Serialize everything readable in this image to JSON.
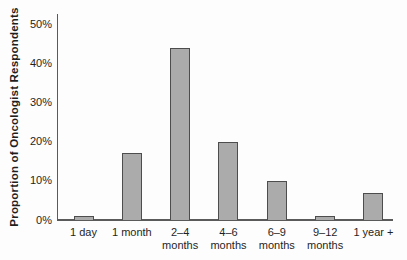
{
  "chart_data": {
    "type": "bar",
    "title": "",
    "xlabel": "",
    "ylabel": "Proportion of Oncologist Respondents",
    "categories": [
      "1 day",
      "1 month",
      "2–4 months",
      "4–6 months",
      "6–9 months",
      "9–12 months",
      "1 year +"
    ],
    "category_lines": [
      [
        "1 day"
      ],
      [
        "1 month"
      ],
      [
        "2–4",
        "months"
      ],
      [
        "4–6",
        "months"
      ],
      [
        "6–9",
        "months"
      ],
      [
        "9–12",
        "months"
      ],
      [
        "1 year +"
      ]
    ],
    "values": [
      1,
      17,
      44,
      20,
      10,
      1,
      7
    ],
    "ylim": [
      0,
      50
    ],
    "yticks": [
      0,
      10,
      20,
      30,
      40,
      50
    ],
    "ytick_labels": [
      "0%",
      "10%",
      "20%",
      "30%",
      "40%",
      "50%"
    ],
    "grid": false,
    "legend": null,
    "colors": {
      "bar_fill": "#ababab",
      "bar_border": "#4d4d4d",
      "axis": "#5a5a5a",
      "text": "#1f1f1f",
      "background": "#fdfdfd"
    }
  }
}
